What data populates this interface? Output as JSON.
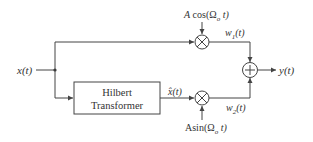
{
  "diagram": {
    "type": "block-diagram",
    "input": {
      "label": "x(t)"
    },
    "output": {
      "label": "y(t)"
    },
    "blocks": [
      {
        "id": "hilbert",
        "line1": "Hilbert",
        "line2": "Transformer"
      }
    ],
    "multipliers": [
      {
        "id": "mult-top",
        "symbol": "⊗",
        "carrier_label": "A cos(Ω_o t)",
        "carrier_prefix": "A cos(Ω",
        "carrier_sub": "o",
        "carrier_suffix": " t)",
        "output_label_base": "w",
        "output_label_sub": "1",
        "output_label_suffix": "(t)"
      },
      {
        "id": "mult-bottom",
        "symbol": "⊗",
        "carrier_label": "A sin(Ω_o t)",
        "carrier_prefix": "Asin(Ω",
        "carrier_sub": "o",
        "carrier_suffix": " t)",
        "output_label_base": "w",
        "output_label_sub": "2",
        "output_label_suffix": "(t)"
      }
    ],
    "adder": {
      "symbol": "+"
    },
    "intermediate": {
      "hilbert_output_label": "x̂(t)"
    },
    "colors": {
      "line": "#444444",
      "text": "#333333",
      "background": "#ffffff"
    }
  }
}
